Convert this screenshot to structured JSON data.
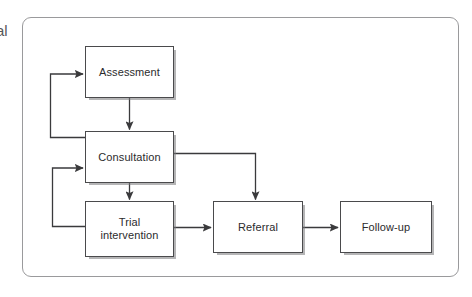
{
  "figure": {
    "type": "flowchart",
    "edge_glyph": "al",
    "frame": {
      "border_color": "#9a9a9c",
      "background": "#ffffff"
    },
    "style": {
      "box_border_color": "#4a4a4c",
      "box_fill": "#ffffff",
      "text_color": "#2b2b2d",
      "connector_color": "#3a3a3c",
      "shadow_color": "#78787a"
    },
    "nodes": [
      {
        "id": "assessment",
        "label": "Assessment"
      },
      {
        "id": "consultation",
        "label": "Consultation"
      },
      {
        "id": "trial",
        "label": "Trial\nintervention"
      },
      {
        "id": "referral",
        "label": "Referral"
      },
      {
        "id": "followup",
        "label": "Follow-up"
      }
    ],
    "connections": [
      {
        "from": "assessment",
        "to": "consultation",
        "kind": "straight-down"
      },
      {
        "from": "consultation",
        "to": "trial",
        "kind": "straight-down"
      },
      {
        "from": "consultation",
        "to": "assessment",
        "kind": "feedback-loop-left"
      },
      {
        "from": "trial",
        "to": "consultation",
        "kind": "feedback-loop-left"
      },
      {
        "from": "consultation",
        "to": "referral",
        "kind": "elbow-right-down"
      },
      {
        "from": "trial",
        "to": "referral",
        "kind": "straight-right"
      },
      {
        "from": "referral",
        "to": "followup",
        "kind": "straight-right"
      }
    ]
  }
}
